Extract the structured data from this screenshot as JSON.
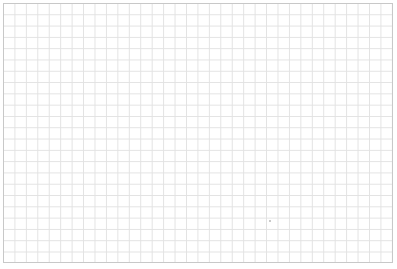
{
  "page": {
    "grid_color": "#e2e2e2",
    "border_color": "#c8c8c8",
    "marker": "dot"
  }
}
